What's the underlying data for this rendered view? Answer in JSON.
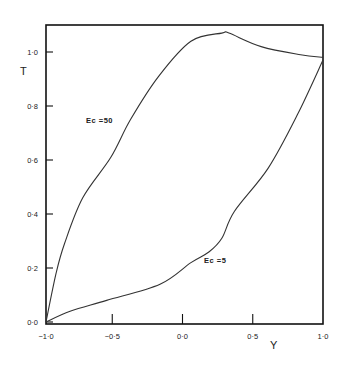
{
  "chart_data": {
    "type": "line",
    "title": "",
    "xlabel": "Y",
    "ylabel": "T",
    "xlim": [
      -1.0,
      1.0
    ],
    "ylim": [
      0.0,
      1.1
    ],
    "grid": false,
    "legend_position": "inline labels",
    "x_ticks": [
      -1.0,
      -0.5,
      0.0,
      0.5,
      1.0
    ],
    "x_tick_labels": [
      "−1·0",
      "−0·5",
      "0·0",
      "0·5",
      "1·0"
    ],
    "y_ticks": [
      0.0,
      0.2,
      0.4,
      0.6,
      0.8,
      1.0
    ],
    "y_tick_labels": [
      "0·0",
      "0·2",
      "0·4",
      "0·6",
      "0·8",
      "1·0"
    ],
    "series": [
      {
        "name": "Ec =50",
        "label_pos": [
          -0.7,
          0.76
        ],
        "x": [
          -1.0,
          -0.9,
          -0.84,
          -0.71,
          -0.51,
          -0.37,
          -0.17,
          0.06,
          0.28,
          0.33,
          0.56,
          0.84,
          1.0
        ],
        "y": [
          0.0,
          0.18,
          0.29,
          0.46,
          0.61,
          0.75,
          0.91,
          1.04,
          1.07,
          1.07,
          1.02,
          0.99,
          0.98
        ]
      },
      {
        "name": "Ec =5",
        "label_pos": [
          0.2,
          0.23
        ],
        "x": [
          -1.0,
          -0.8,
          -0.54,
          -0.16,
          0.06,
          0.19,
          0.28,
          0.37,
          0.61,
          0.82,
          1.0
        ],
        "y": [
          0.0,
          0.04,
          0.08,
          0.14,
          0.22,
          0.26,
          0.31,
          0.41,
          0.57,
          0.77,
          0.97
        ]
      }
    ]
  },
  "labels": {
    "x_axis_title": "Y",
    "y_axis_title": "T",
    "series_0_label": "Ec =50",
    "series_1_label": "Ec =5"
  }
}
